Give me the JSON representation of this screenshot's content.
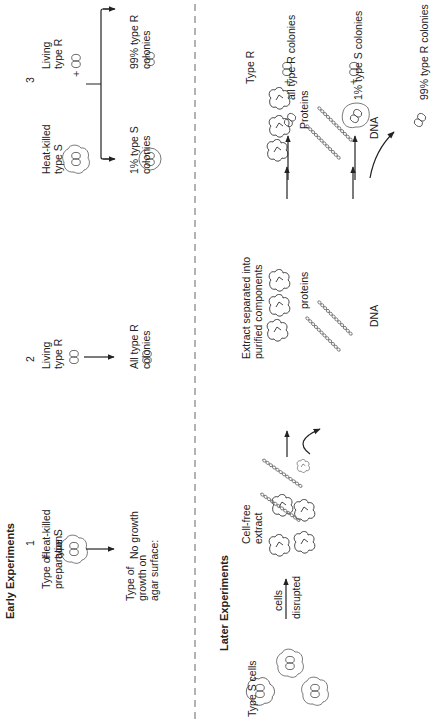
{
  "early": {
    "heading": "Early Experiments",
    "row_labels": {
      "preparation": [
        "Type of",
        "preparation:"
      ],
      "growth": [
        "Type of",
        "growth on",
        "agar surface:"
      ]
    },
    "experiments": [
      {
        "number": "1",
        "prep": [
          "Heat-killed",
          "type S"
        ],
        "result": [
          "No growth"
        ]
      },
      {
        "number": "2",
        "prep": [
          "Living",
          "type R"
        ],
        "result": [
          "All type R",
          "colonies"
        ]
      },
      {
        "number": "3",
        "prep_a": [
          "Heat-killed",
          "type S"
        ],
        "plus": "+",
        "prep_b": [
          "Living",
          "type R"
        ],
        "result_a": [
          "1% type S",
          "colonies"
        ],
        "result_b": [
          "99% type R",
          "colonies"
        ]
      }
    ]
  },
  "later": {
    "heading": "Later Experiments",
    "type_s_cells": "Type S cells",
    "arrow_top": "cells",
    "arrow_bottom": "disrupted",
    "cell_free": [
      "Cell-free",
      "extract"
    ],
    "separated": [
      "Extract separated into",
      "purified components"
    ],
    "proteins_label": "proteins",
    "dna_label": "DNA",
    "proteins_label2": "Proteins",
    "dna_label2": "DNA",
    "plus": "+",
    "type_r": "Type R",
    "results": {
      "proteins": "all type R colonies",
      "dna_s": "1% type S colonies",
      "dna_r": "99% type R colonies"
    }
  },
  "colors": {
    "ink": "#222222",
    "line": "#333333",
    "background": "#ffffff"
  }
}
